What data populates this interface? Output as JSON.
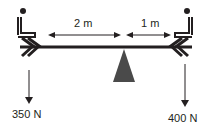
{
  "diagram": {
    "type": "seesaw-torque",
    "left_distance_label": "2 m",
    "right_distance_label": "1 m",
    "left_force_label": "350 N",
    "right_force_label": "400 N",
    "colors": {
      "ink": "#231f20",
      "fulcrum": "#4a4a4a",
      "background": "#ffffff"
    }
  }
}
